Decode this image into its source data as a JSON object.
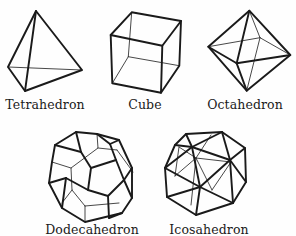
{
  "figure": {
    "solids": [
      {
        "name": "Tetrahedron",
        "label": "Tetrahedron",
        "faces": 4
      },
      {
        "name": "Cube",
        "label": "Cube",
        "faces": 6
      },
      {
        "name": "Octahedron",
        "label": "Octahedron",
        "faces": 8
      },
      {
        "name": "Dodecahedron",
        "label": "Dodecahedron",
        "faces": 12
      },
      {
        "name": "Icosahedron",
        "label": "Icosahedron",
        "faces": 20
      }
    ],
    "colors": {
      "line": "#1a1a1a",
      "background": "#fefefe"
    }
  }
}
